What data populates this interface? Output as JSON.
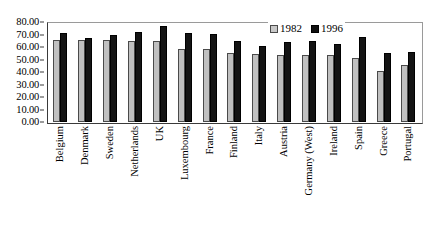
{
  "chart_data": {
    "type": "bar",
    "title": "",
    "xlabel": "",
    "ylabel": "",
    "ylim": [
      0,
      80
    ],
    "ytick_step": 10,
    "grid": false,
    "legend_position": "top-right",
    "categories": [
      "Belgium",
      "Denmark",
      "Sweden",
      "Netherlands",
      "UK",
      "Luxembourg",
      "France",
      "Finland",
      "Italy",
      "Austria",
      "Germany (West)",
      "Ireland",
      "Spain",
      "Greece",
      "Portugal"
    ],
    "ytick_labels": [
      "80.00",
      "70.00",
      "60.00",
      "50.00",
      "40.00",
      "30.00",
      "20.00",
      "10.00",
      "0.00"
    ],
    "series": [
      {
        "name": "1982",
        "color": "#c0c0c0",
        "values": [
          66.0,
          65.5,
          65.5,
          65.0,
          64.5,
          58.5,
          58.5,
          55.0,
          54.5,
          54.0,
          54.0,
          53.5,
          51.0,
          41.0,
          46.0
        ]
      },
      {
        "name": "1996",
        "color": "#141414",
        "values": [
          71.5,
          67.5,
          69.5,
          72.0,
          76.5,
          71.0,
          70.5,
          64.5,
          61.0,
          64.0,
          64.5,
          62.5,
          68.0,
          55.0,
          56.0
        ]
      }
    ]
  }
}
